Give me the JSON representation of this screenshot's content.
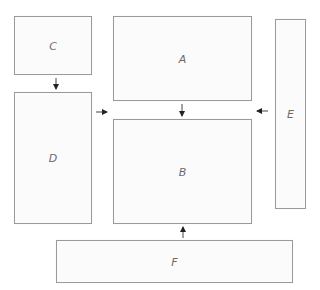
{
  "diagram": {
    "nodes": [
      {
        "id": "A",
        "label": "A",
        "x": 113,
        "y": 16,
        "w": 139,
        "h": 85
      },
      {
        "id": "B",
        "label": "B",
        "x": 113,
        "y": 119,
        "w": 139,
        "h": 105
      },
      {
        "id": "C",
        "label": "C",
        "x": 14,
        "y": 16,
        "w": 78,
        "h": 59
      },
      {
        "id": "D",
        "label": "D",
        "x": 14,
        "y": 92,
        "w": 78,
        "h": 132
      },
      {
        "id": "E",
        "label": "E",
        "x": 275,
        "y": 19,
        "w": 31,
        "h": 190
      },
      {
        "id": "F",
        "label": "F",
        "x": 56,
        "y": 240,
        "w": 237,
        "h": 43
      }
    ],
    "edges": [
      {
        "from": "C",
        "to": "D",
        "direction": "down"
      },
      {
        "from": "A",
        "to": "B",
        "direction": "down"
      },
      {
        "from": "D",
        "to": "B",
        "direction": "right"
      },
      {
        "from": "E",
        "to": "B",
        "direction": "left"
      },
      {
        "from": "F",
        "to": "B",
        "direction": "up"
      }
    ],
    "colors": {
      "border": "#9a9a9a",
      "label": "#6a6a6a",
      "arrow": "#222222"
    }
  }
}
